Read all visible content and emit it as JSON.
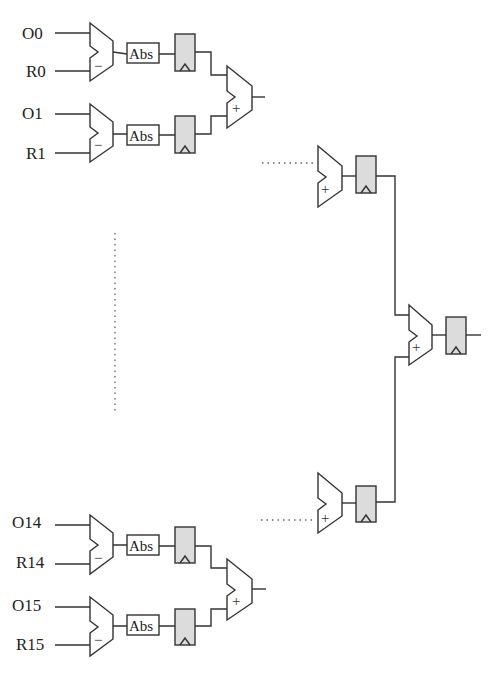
{
  "diagram": {
    "type": "adder-tree-sad",
    "inputs_top": [
      {
        "o": "O0",
        "r": "R0"
      },
      {
        "o": "O1",
        "r": "R1"
      }
    ],
    "inputs_bottom": [
      {
        "o": "O14",
        "r": "R14"
      },
      {
        "o": "O15",
        "r": "R15"
      }
    ],
    "abs_label": "Abs",
    "subtract_symbol": "−",
    "add_symbol": "+",
    "colors": {
      "line": "#333333",
      "register_fill": "#dcdcdc",
      "background": "#ffffff"
    }
  }
}
